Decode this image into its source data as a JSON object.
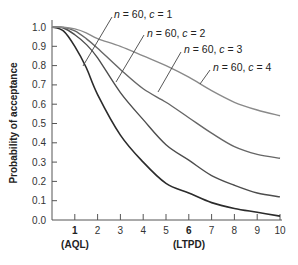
{
  "chart_data": {
    "type": "line",
    "title": "",
    "xlabel": "",
    "ylabel": "Probability of acceptance",
    "xlim": [
      0,
      10
    ],
    "ylim": [
      0,
      1.0
    ],
    "grid": false,
    "legend_position": "inline-annotations",
    "x_ticks": [
      1,
      2,
      3,
      4,
      5,
      6,
      7,
      8,
      9,
      10
    ],
    "y_ticks": [
      "0.0",
      "0.1",
      "0.2",
      "0.3",
      "0.4",
      "0.5",
      "0.6",
      "0.7",
      "0.8",
      "0.9",
      "1.0"
    ],
    "x_annotations": [
      {
        "x": 1,
        "label": "(AQL)"
      },
      {
        "x": 6,
        "label": "(LTPD)"
      }
    ],
    "x": [
      0,
      0.5,
      1,
      1.5,
      2,
      3,
      4,
      5,
      6,
      7,
      8,
      9,
      10
    ],
    "series": [
      {
        "name": "n = 60, c = 1",
        "n": "60",
        "c": "1",
        "color": "#2b2b2b",
        "values": [
          1.0,
          0.98,
          0.9,
          0.79,
          0.65,
          0.44,
          0.3,
          0.19,
          0.14,
          0.09,
          0.06,
          0.04,
          0.02
        ]
      },
      {
        "name": "n = 60, c = 2",
        "n": "60",
        "c": "2",
        "color": "#4d4d4d",
        "values": [
          1.0,
          0.995,
          0.96,
          0.91,
          0.84,
          0.66,
          0.52,
          0.39,
          0.31,
          0.23,
          0.18,
          0.14,
          0.12
        ]
      },
      {
        "name": "n = 60, c = 3",
        "n": "60",
        "c": "3",
        "color": "#666666",
        "values": [
          1.0,
          0.998,
          0.98,
          0.94,
          0.89,
          0.78,
          0.68,
          0.61,
          0.53,
          0.45,
          0.38,
          0.34,
          0.32
        ]
      },
      {
        "name": "n = 60, c = 4",
        "n": "60",
        "c": "4",
        "color": "#8a8a8a",
        "values": [
          1.0,
          0.999,
          0.99,
          0.97,
          0.94,
          0.9,
          0.85,
          0.8,
          0.74,
          0.67,
          0.61,
          0.57,
          0.54
        ]
      }
    ]
  },
  "labels": {
    "ylabel": "Probability of acceptance",
    "aql": "(AQL)",
    "ltpd": "(LTPD)",
    "series": [
      {
        "n_var": "n",
        "n_text": " = 60, ",
        "c_var": "c",
        "c_text": " = 1"
      },
      {
        "n_var": "n",
        "n_text": " = 60, ",
        "c_var": "c",
        "c_text": " = 2"
      },
      {
        "n_var": "n",
        "n_text": " = 60, ",
        "c_var": "c",
        "c_text": " = 3"
      },
      {
        "n_var": "n",
        "n_text": " = 60, ",
        "c_var": "c",
        "c_text": " = 4"
      }
    ]
  }
}
